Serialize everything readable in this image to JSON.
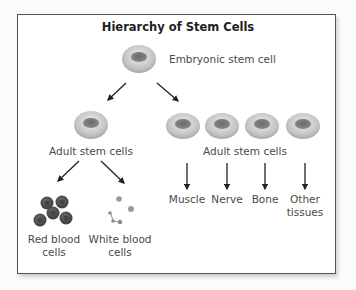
{
  "title": "Hierarchy of Stem Cells",
  "nodes": {
    "embryonic": "Embryonic stem cell",
    "adult_left": "Adult stem cells",
    "adult_right": "Adult stem cells",
    "red_blood": [
      "Red blood",
      "cells"
    ],
    "white_blood": [
      "White blood",
      "cells"
    ],
    "muscle": "Muscle",
    "nerve": "Nerve",
    "bone": "Bone",
    "other": [
      "Other",
      "tissues"
    ]
  },
  "colors": {
    "cell_outer": "#c9c9c9",
    "cell_nucleus": "#6e6e6e",
    "red_blood_cell": "#5a5a5a",
    "white_blood_cell": "#9a9a9a",
    "arrow": "#222222",
    "frame": "#555555"
  }
}
